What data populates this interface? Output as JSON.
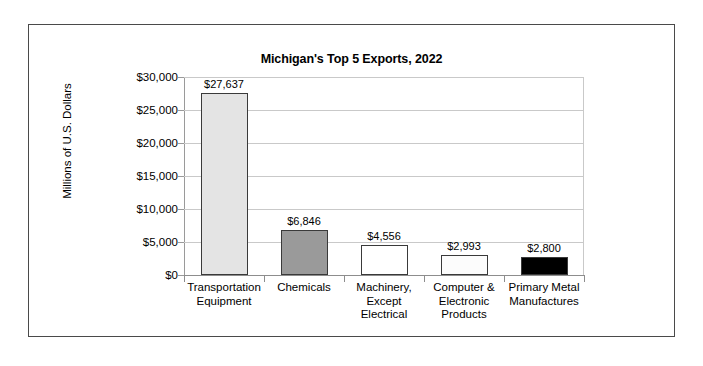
{
  "chart_data": {
    "type": "bar",
    "title": "Michigan's Top 5 Exports, 2022",
    "xlabel": "",
    "ylabel": "Millions of U.S. Dollars",
    "categories": [
      "Transportation Equipment",
      "Chemicals",
      "Machinery, Except Electrical",
      "Computer & Electronic Products",
      "Primary Metal Manufactures"
    ],
    "category_lines": [
      [
        "Transportation",
        "Equipment"
      ],
      [
        "Chemicals"
      ],
      [
        "Machinery,",
        "Except",
        "Electrical"
      ],
      [
        "Computer &",
        "Electronic",
        "Products"
      ],
      [
        "Primary Metal",
        "Manufactures"
      ]
    ],
    "values": [
      27637,
      6846,
      4556,
      2993,
      2800
    ],
    "value_labels": [
      "$27,637",
      "$6,846",
      "$4,556",
      "$2,993",
      "$2,800"
    ],
    "bar_colors": [
      "#e4e4e4",
      "#9a9a9a",
      "#ffffff",
      "#fcfcfc",
      "#000000"
    ],
    "bar_border_color": "#3a3a3a",
    "ylim": [
      0,
      30000
    ],
    "ytick_values": [
      0,
      5000,
      10000,
      15000,
      20000,
      25000,
      30000
    ],
    "ytick_labels": [
      "$0",
      "$5,000",
      "$10,000",
      "$15,000",
      "$20,000",
      "$25,000",
      "$30,000"
    ],
    "grid": true,
    "legend": false,
    "gridline_color": "#c9c9c9",
    "frame_color": "#4a4a4a"
  }
}
